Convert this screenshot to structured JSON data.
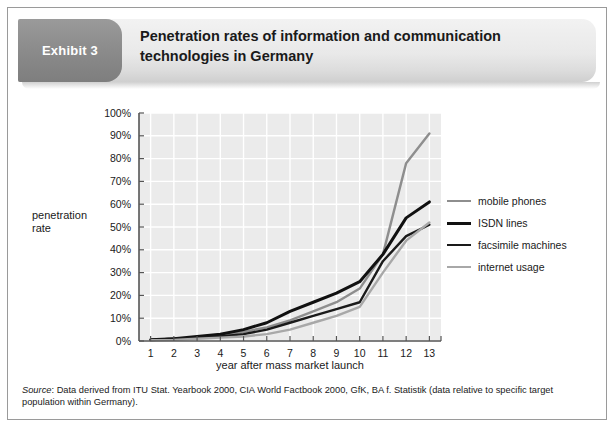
{
  "exhibit": {
    "badge_label": "Exhibit 3",
    "title_line1": "Penetration rates of information and communication",
    "title_line2": "technologies in Germany",
    "badge_color": "#8b8b8b",
    "header_color": "#e9e9e9"
  },
  "axes": {
    "ylabel_line1": "penetration",
    "ylabel_line2": "rate",
    "xlabel": "year after mass market launch",
    "yticks": [
      "100%",
      "90%",
      "80%",
      "70%",
      "60%",
      "50%",
      "40%",
      "30%",
      "20%",
      "10%",
      "0%"
    ],
    "xticks": [
      "1",
      "2",
      "3",
      "4",
      "5",
      "6",
      "7",
      "8",
      "9",
      "10",
      "11",
      "12",
      "13"
    ]
  },
  "legend": {
    "items": [
      {
        "label": "mobile phones",
        "color": "#8e8e8e",
        "width": 2.4
      },
      {
        "label": "ISDN lines",
        "color": "#111111",
        "width": 3.0
      },
      {
        "label": "facsimile machines",
        "color": "#1a1a1a",
        "width": 2.4
      },
      {
        "label": "internet usage",
        "color": "#a8a8a8",
        "width": 2.4
      }
    ]
  },
  "source": {
    "prefix": "Source",
    "text": ": Data derived from ITU Stat. Yearbook 2000, CIA World Factbook 2000, GfK, BA f. Statistik (data relative to specific target population within Germany)."
  },
  "chart_data": {
    "type": "line",
    "title": "Penetration rates of information and communication technologies in Germany",
    "xlabel": "year after mass market launch",
    "ylabel": "penetration rate",
    "x": [
      1,
      2,
      3,
      4,
      5,
      6,
      7,
      8,
      9,
      10,
      11,
      12,
      13
    ],
    "xlim": [
      0.5,
      13.5
    ],
    "ylim": [
      0,
      100
    ],
    "ytick_step": 10,
    "grid": true,
    "legend_position": "right",
    "series": [
      {
        "name": "mobile phones",
        "color": "#8e8e8e",
        "values": [
          0.5,
          1,
          1.5,
          2.5,
          4,
          6,
          9,
          13,
          17,
          23,
          38,
          78,
          91
        ]
      },
      {
        "name": "ISDN lines",
        "color": "#111111",
        "values": [
          0.5,
          1,
          2,
          3,
          5,
          8,
          13,
          17,
          21,
          26,
          38,
          54,
          61
        ]
      },
      {
        "name": "facsimile machines",
        "color": "#1a1a1a",
        "values": [
          0.5,
          1,
          1.5,
          2,
          3,
          5,
          8,
          11,
          14,
          17,
          35,
          46,
          51
        ]
      },
      {
        "name": "internet usage",
        "color": "#a8a8a8",
        "values": [
          0.3,
          0.5,
          1,
          1.5,
          2,
          3,
          5,
          8,
          11,
          15,
          30,
          44,
          52
        ]
      }
    ]
  }
}
